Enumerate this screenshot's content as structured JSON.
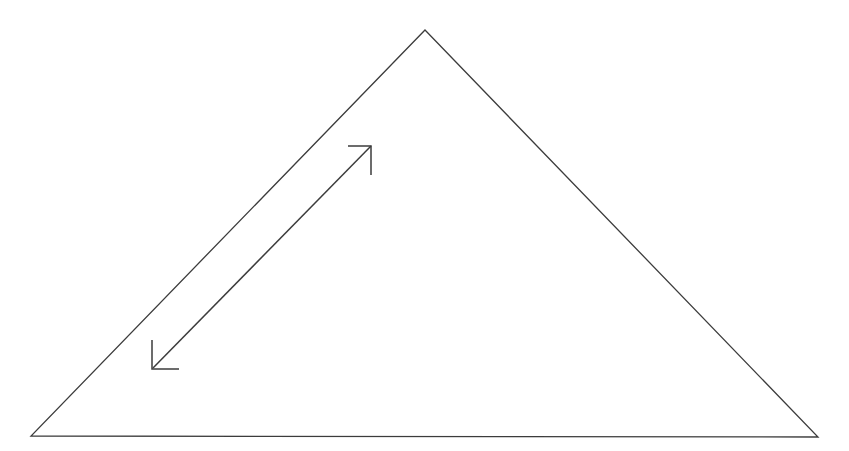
{
  "figure": {
    "title": "Triangle with internal double-headed arrow",
    "canvas": {
      "width": 849,
      "height": 451,
      "background_color": "#ffffff"
    },
    "style": {
      "stroke_color": "#3c3c3c",
      "triangle_stroke_width": 1.3,
      "arrow_stroke_width": 1.5,
      "fill": "none"
    },
    "shapes": {
      "triangle": {
        "name": "triangle-outline",
        "kind": "polygon",
        "closed": true,
        "vertices": [
          {
            "label": "apex",
            "x": 425,
            "y": 30
          },
          {
            "label": "bottom-right",
            "x": 818,
            "y": 437
          },
          {
            "label": "bottom-left",
            "x": 31,
            "y": 436
          }
        ],
        "edges": [
          {
            "label": "left-edge",
            "from": "apex",
            "to": "bottom-left"
          },
          {
            "label": "base-edge",
            "from": "bottom-left",
            "to": "bottom-right"
          },
          {
            "label": "right-edge",
            "from": "bottom-right",
            "to": "apex"
          }
        ],
        "path": "M 425 30 L 818 437 L 31 436 Z"
      },
      "arrow": {
        "name": "double-headed-arrow",
        "kind": "line-with-two-arrowheads",
        "shaft": {
          "from": {
            "label": "lower-left-end",
            "x": 153,
            "y": 368
          },
          "to": {
            "label": "upper-right-end",
            "x": 371,
            "y": 146
          },
          "path": "M 153 368 L 371 146"
        },
        "head_upper": {
          "name": "upper-right-arrowhead",
          "style": "open-L-shaped-barbs",
          "tip": {
            "x": 371,
            "y": 146
          },
          "barb_horizontal_to": {
            "x": 348,
            "y": 146
          },
          "barb_vertical_to": {
            "x": 371,
            "y": 175
          },
          "path": "M 348 146 L 371 146 L 371 175"
        },
        "head_lower": {
          "name": "lower-left-arrowhead",
          "style": "open-L-shaped-barbs",
          "tip": {
            "x": 153,
            "y": 368
          },
          "barb_vertical_to": {
            "x": 152,
            "y": 340
          },
          "barb_horizontal_to": {
            "x": 179,
            "y": 369
          },
          "path": "M 152 340 L 152 369 L 179 369"
        }
      }
    }
  }
}
